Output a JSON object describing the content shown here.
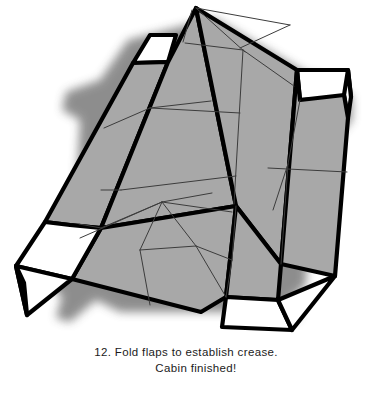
{
  "figure": {
    "title": "Folded cabin papercraft diagram",
    "type": "isometric-line-diagram",
    "colors": {
      "panel_fill": "#a8a8a8",
      "flap_fill": "#ffffff",
      "outline": "#000000",
      "crease_line": "#3c3c3c",
      "shadow": "#4a4a4a",
      "background": "#ffffff",
      "text": "#1b1b1b"
    },
    "stroke_widths": {
      "outline": 4.2,
      "crease": 1.0
    },
    "parts": [
      {
        "name": "roof-top-panel",
        "fill": "panel_fill"
      },
      {
        "name": "roof-left-slope-panel",
        "fill": "panel_fill"
      },
      {
        "name": "roof-right-slope-panel",
        "fill": "panel_fill"
      },
      {
        "name": "cabin-front-face",
        "fill": "panel_fill"
      },
      {
        "name": "cabin-right-face",
        "fill": "panel_fill"
      },
      {
        "name": "flap-top-left",
        "fill": "flap_fill"
      },
      {
        "name": "flap-top-right",
        "fill": "flap_fill"
      },
      {
        "name": "flap-bottom-left",
        "fill": "flap_fill"
      },
      {
        "name": "flap-bottom-right",
        "fill": "flap_fill"
      }
    ],
    "flap_count": 4
  },
  "caption": {
    "step_number": "12.",
    "line1": "12. Fold flaps to establish crease.",
    "line2": "Cabin finished!"
  }
}
